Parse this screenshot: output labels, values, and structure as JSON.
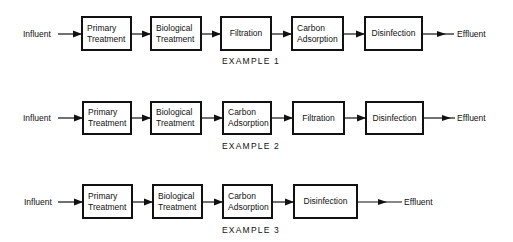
{
  "diagram": {
    "type": "process-flow",
    "rows": [
      {
        "caption": "EXAMPLE 1",
        "input": "Influent",
        "output": "Effluent",
        "steps": [
          "Primary\nTreatment",
          "Biological\nTreatment",
          "Filtration",
          "Carbon\nAdsorption",
          "Disinfection"
        ]
      },
      {
        "caption": "EXAMPLE 2",
        "input": "Influent",
        "output": "Effluent",
        "steps": [
          "Primary\nTreatment",
          "Biological\nTreatment",
          "Carbon\nAdsorption",
          "Filtration",
          "Disinfection"
        ]
      },
      {
        "caption": "EXAMPLE 3",
        "input": "Influent",
        "output": "Effluent",
        "steps": [
          "Primary\nTreatment",
          "Biological\nTreatment",
          "Carbon\nAdsorption",
          "Disinfection"
        ]
      }
    ],
    "colors": {
      "line": "#111111",
      "background": "#ffffff"
    }
  }
}
